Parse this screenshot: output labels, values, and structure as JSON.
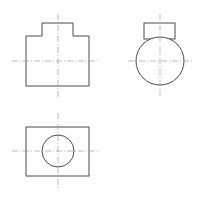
{
  "drawing": {
    "type": "orthographic-projection",
    "colors": {
      "background": "#ffffff",
      "outline": "#4a4a4a",
      "centerline": "#8a8a8a"
    },
    "views": {
      "front": {
        "outline_points": "26,36 42,36 42,23 73,23 73,36 89,36 89,86 26,86",
        "centerline_v": {
          "x1": 58,
          "y1": 14,
          "x2": 58,
          "y2": 97
        },
        "centerline_h": {
          "x1": 12,
          "y1": 61,
          "x2": 100,
          "y2": 61
        }
      },
      "side": {
        "boss": {
          "x": 144,
          "y": 23,
          "w": 31,
          "h": 16
        },
        "circle": {
          "cx": 160,
          "cy": 61,
          "r": 24
        },
        "centerline_v": {
          "x1": 160,
          "y1": 14,
          "x2": 160,
          "y2": 96
        },
        "centerline_h": {
          "x1": 128,
          "y1": 61,
          "x2": 193,
          "y2": 61
        }
      },
      "top": {
        "rect": {
          "x": 26,
          "y": 127,
          "w": 63,
          "h": 49
        },
        "circle": {
          "cx": 58,
          "cy": 151,
          "r": 16
        },
        "centerline_v": {
          "x1": 58,
          "y1": 113,
          "x2": 58,
          "y2": 190
        },
        "centerline_h": {
          "x1": 12,
          "y1": 151,
          "x2": 100,
          "y2": 151
        }
      }
    }
  }
}
